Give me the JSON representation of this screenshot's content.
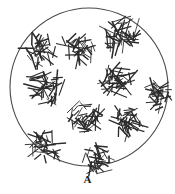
{
  "figure": {
    "kind": "scientific-diagram",
    "panel_label": "A",
    "label_position": {
      "x": 87,
      "y": 180
    },
    "background_color": "#ffffff",
    "ink_color": "#2b2b2b",
    "outline_color": "#4a4a4a",
    "width": 175,
    "height": 194
  },
  "field": {
    "name": "circular-field-of-view",
    "shape": "circle",
    "center_x": 89,
    "center_y": 87,
    "radius_x": 79,
    "radius_y": 79,
    "stroke_width": 1.1,
    "fill": "none"
  },
  "clusters": [
    {
      "id": "cluster-upper-left",
      "cx": 40,
      "cy": 50,
      "radius": 16,
      "segments": 34,
      "seg_len_min": 6,
      "seg_len_max": 17,
      "seed": 11
    },
    {
      "id": "cluster-upper-center",
      "cx": 78,
      "cy": 48,
      "radius": 16,
      "segments": 36,
      "seg_len_min": 6,
      "seg_len_max": 18,
      "seed": 23
    },
    {
      "id": "cluster-upper-right",
      "cx": 122,
      "cy": 36,
      "radius": 18,
      "segments": 42,
      "seg_len_min": 7,
      "seg_len_max": 20,
      "seed": 37
    },
    {
      "id": "cluster-mid-left",
      "cx": 46,
      "cy": 88,
      "radius": 17,
      "segments": 40,
      "seg_len_min": 7,
      "seg_len_max": 19,
      "seed": 53
    },
    {
      "id": "cluster-mid-right",
      "cx": 120,
      "cy": 82,
      "radius": 17,
      "segments": 38,
      "seg_len_min": 7,
      "seg_len_max": 19,
      "seed": 67
    },
    {
      "id": "cluster-right-edge",
      "cx": 158,
      "cy": 96,
      "radius": 14,
      "segments": 30,
      "seg_len_min": 6,
      "seg_len_max": 16,
      "seed": 79
    },
    {
      "id": "cluster-center",
      "cx": 85,
      "cy": 117,
      "radius": 16,
      "segments": 38,
      "seg_len_min": 6,
      "seg_len_max": 18,
      "seed": 91
    },
    {
      "id": "cluster-lower-right",
      "cx": 126,
      "cy": 122,
      "radius": 16,
      "segments": 36,
      "seg_len_min": 6,
      "seg_len_max": 18,
      "seed": 103
    },
    {
      "id": "cluster-lower-left",
      "cx": 45,
      "cy": 146,
      "radius": 15,
      "segments": 34,
      "seg_len_min": 6,
      "seg_len_max": 17,
      "seed": 117
    },
    {
      "id": "cluster-bottom-center",
      "cx": 98,
      "cy": 160,
      "radius": 15,
      "segments": 34,
      "seg_len_min": 6,
      "seg_len_max": 17,
      "seed": 131
    }
  ],
  "cluster_count": 10
}
